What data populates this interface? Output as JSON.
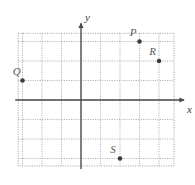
{
  "chart_data": {
    "type": "scatter",
    "title": "",
    "xlabel": "x",
    "ylabel": "y",
    "grid": true,
    "legend": "none",
    "xlim": [
      -3.2,
      4.8
    ],
    "ylim": [
      -3.3,
      3.4
    ],
    "xtick_step": 1,
    "ytick_step": 1,
    "axis_arrows": [
      "x-positive",
      "y-positive"
    ],
    "points": [
      {
        "label": "P",
        "x": 3,
        "y": 3,
        "label_dx": -0.45,
        "label_dy": 0.55
      },
      {
        "label": "R",
        "x": 4,
        "y": 2,
        "label_dx": -0.45,
        "label_dy": 0.55
      },
      {
        "label": "Q",
        "x": -3,
        "y": 1,
        "label_dx": -0.45,
        "label_dy": 0.55
      },
      {
        "label": "S",
        "x": 2,
        "y": -3,
        "label_dx": -0.45,
        "label_dy": 0.55
      }
    ]
  },
  "figure": {
    "axis_label_x": "x",
    "axis_label_y": "y",
    "point_labels": [
      "P",
      "R",
      "Q",
      "S"
    ]
  },
  "colors": {
    "grid": "#9a9a9a",
    "axis": "#4a4a4a",
    "point": "#3c3c3c",
    "label": "#5a5a5a",
    "background": "#ffffff"
  }
}
